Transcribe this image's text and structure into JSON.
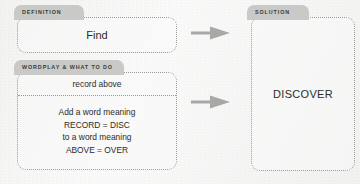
{
  "theme": {
    "background": "#f5f5f4",
    "tab_fill": "#c9c9c7",
    "border": "#9a9a97",
    "text": "#2b2b29",
    "arrow_fill": "#a8a8a6"
  },
  "definition": {
    "tab_label": "DEFINITION",
    "text": "Find"
  },
  "wordplay": {
    "tab_label": "WORDPLAY & WHAT TO DO",
    "cryptic_text": "record above",
    "steps": [
      "Add a word meaning",
      "RECORD = DISC",
      "to a word meaning",
      "ABOVE = OVER"
    ]
  },
  "solution": {
    "tab_label": "SOLUTION",
    "answer": "DISCOVER"
  },
  "arrows": [
    {
      "name": "arrow-definition-to-solution",
      "direction": "right"
    },
    {
      "name": "arrow-wordplay-to-solution",
      "direction": "right"
    }
  ]
}
